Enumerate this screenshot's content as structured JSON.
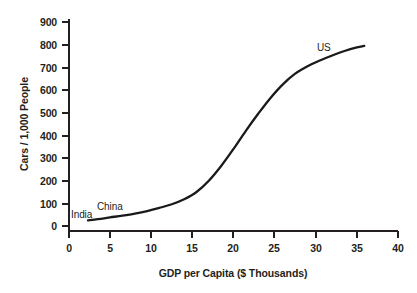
{
  "chart_data": {
    "type": "line",
    "title": "",
    "xlabel": "GDP per Capita ($ Thousands)",
    "ylabel": "Cars / 1,000 People",
    "xlim": [
      0,
      40
    ],
    "ylim": [
      0,
      900
    ],
    "xticks": [
      0,
      5,
      10,
      15,
      20,
      25,
      30,
      35,
      40
    ],
    "xtick_labels": [
      "0",
      "5",
      "10",
      "15",
      "20",
      "25",
      "30",
      "35",
      "40"
    ],
    "yticks": [
      0,
      100,
      200,
      300,
      400,
      500,
      600,
      700,
      800,
      900
    ],
    "ytick_labels": [
      "0",
      "100",
      "200",
      "300",
      "400",
      "500",
      "600",
      "700",
      "800",
      "900"
    ],
    "grid": false,
    "legend": "none",
    "line_color": "#1a1a1a",
    "line_width": 2.3,
    "series": [
      {
        "name": "Car ownership vs income",
        "x": [
          2.3,
          3.5,
          5.0,
          6.5,
          8.0,
          9.5,
          11.0,
          12.5,
          14.0,
          15.5,
          17.0,
          18.5,
          20.0,
          21.5,
          23.0,
          24.5,
          26.0,
          27.5,
          29.0,
          30.5,
          32.0,
          33.5,
          35.0,
          35.9
        ],
        "values": [
          25,
          30,
          38,
          46,
          55,
          66,
          80,
          96,
          118,
          150,
          200,
          265,
          340,
          420,
          495,
          565,
          625,
          672,
          705,
          730,
          752,
          772,
          788,
          795
        ]
      }
    ],
    "annotations": [
      {
        "text": "India",
        "x": 2.6,
        "y": 60
      },
      {
        "text": "China",
        "x": 5.8,
        "y": 105
      },
      {
        "text": "US",
        "x": 30.6,
        "y": 770
      }
    ]
  },
  "axes": {
    "x_title": "GDP per Capita ($ Thousands)",
    "y_title": "Cars / 1,000 People"
  },
  "labels": {
    "india": "India",
    "china": "China",
    "us": "US"
  },
  "yticks": {
    "t900": "900",
    "t800": "800",
    "t700": "700",
    "t600": "600",
    "t500": "500",
    "t400": "400",
    "t300": "300",
    "t200": "200",
    "t100": "100",
    "t0": "0"
  },
  "xticks": {
    "t0": "0",
    "t5": "5",
    "t10": "10",
    "t15": "15",
    "t20": "20",
    "t25": "25",
    "t30": "30",
    "t35": "35",
    "t40": "40"
  }
}
